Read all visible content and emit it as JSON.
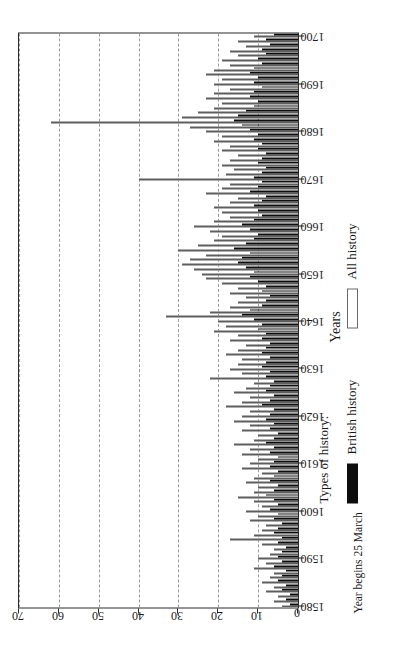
{
  "figure": {
    "y_axis_title": "Occurrences of titles",
    "x_axis_title": "Years",
    "x_axis_note": "Year begins 25 March"
  },
  "legend": {
    "title": "Types of history:",
    "items": [
      {
        "label": "British history",
        "swatch": "black-filled-swatch",
        "color": "#0d0d0d"
      },
      {
        "label": "All history",
        "swatch": "white-outlined-swatch",
        "color": "#ffffff"
      }
    ]
  },
  "chart_data": {
    "type": "bar",
    "title": "",
    "subtitle": "",
    "orientation": "horizontal-rotated",
    "xlabel": "Years",
    "ylabel": "Occurrences of titles",
    "xlim": [
      1580,
      1700
    ],
    "ylim": [
      0,
      70
    ],
    "yticks": [
      0,
      10,
      20,
      30,
      40,
      50,
      60,
      70
    ],
    "xticks": [
      1580,
      1590,
      1600,
      1610,
      1620,
      1630,
      1640,
      1650,
      1660,
      1670,
      1680,
      1690,
      1700
    ],
    "grid": "dashed-gridlines-at-y-multiples-of-10",
    "legend_position": "below-axis-left",
    "annotations": [
      "Year begins 25 March"
    ],
    "x": [
      1580,
      1581,
      1582,
      1583,
      1584,
      1585,
      1586,
      1587,
      1588,
      1589,
      1590,
      1591,
      1592,
      1593,
      1594,
      1595,
      1596,
      1597,
      1598,
      1599,
      1600,
      1601,
      1602,
      1603,
      1604,
      1605,
      1606,
      1607,
      1608,
      1609,
      1610,
      1611,
      1612,
      1613,
      1614,
      1615,
      1616,
      1617,
      1618,
      1619,
      1620,
      1621,
      1622,
      1623,
      1624,
      1625,
      1626,
      1627,
      1628,
      1629,
      1630,
      1631,
      1632,
      1633,
      1634,
      1635,
      1636,
      1637,
      1638,
      1639,
      1640,
      1641,
      1642,
      1643,
      1644,
      1645,
      1646,
      1647,
      1648,
      1649,
      1650,
      1651,
      1652,
      1653,
      1654,
      1655,
      1656,
      1657,
      1658,
      1659,
      1660,
      1661,
      1662,
      1663,
      1664,
      1665,
      1666,
      1667,
      1668,
      1669,
      1670,
      1671,
      1672,
      1673,
      1674,
      1675,
      1676,
      1677,
      1678,
      1679,
      1680,
      1681,
      1682,
      1683,
      1684,
      1685,
      1686,
      1687,
      1688,
      1689,
      1690,
      1691,
      1692,
      1693,
      1694,
      1695,
      1696,
      1697,
      1698,
      1699,
      1700
    ],
    "series": [
      {
        "name": "British history",
        "color": "#0d0d0d",
        "values": [
          2,
          3,
          2,
          4,
          3,
          5,
          4,
          3,
          6,
          4,
          5,
          4,
          3,
          5,
          4,
          6,
          5,
          4,
          6,
          5,
          7,
          5,
          6,
          8,
          6,
          5,
          7,
          6,
          5,
          7,
          6,
          5,
          7,
          6,
          8,
          6,
          5,
          7,
          6,
          8,
          7,
          6,
          9,
          7,
          6,
          8,
          7,
          6,
          8,
          7,
          9,
          8,
          7,
          9,
          8,
          7,
          9,
          8,
          10,
          9,
          11,
          14,
          12,
          9,
          8,
          7,
          9,
          8,
          10,
          12,
          11,
          13,
          15,
          14,
          12,
          16,
          13,
          11,
          10,
          12,
          14,
          11,
          9,
          10,
          11,
          9,
          8,
          12,
          10,
          9,
          11,
          9,
          8,
          10,
          9,
          8,
          10,
          9,
          11,
          10,
          12,
          14,
          16,
          15,
          13,
          11,
          10,
          12,
          11,
          9,
          11,
          10,
          12,
          11,
          9,
          10,
          8,
          9,
          7,
          8,
          6
        ]
      },
      {
        "name": "All history",
        "color": "#ffffff",
        "values": [
          4,
          6,
          5,
          8,
          6,
          9,
          7,
          6,
          11,
          8,
          10,
          7,
          6,
          9,
          17,
          11,
          9,
          8,
          12,
          10,
          13,
          9,
          11,
          15,
          11,
          10,
          13,
          11,
          9,
          14,
          12,
          10,
          14,
          12,
          16,
          11,
          10,
          14,
          12,
          16,
          14,
          12,
          18,
          14,
          12,
          16,
          13,
          11,
          22,
          14,
          17,
          15,
          14,
          18,
          15,
          13,
          17,
          15,
          21,
          18,
          20,
          33,
          22,
          17,
          15,
          13,
          17,
          15,
          19,
          23,
          24,
          26,
          29,
          27,
          23,
          30,
          25,
          21,
          19,
          22,
          26,
          21,
          17,
          19,
          21,
          17,
          15,
          23,
          19,
          17,
          40,
          18,
          16,
          19,
          17,
          15,
          19,
          17,
          21,
          19,
          23,
          27,
          62,
          29,
          25,
          21,
          19,
          23,
          21,
          17,
          21,
          19,
          23,
          21,
          17,
          19,
          15,
          17,
          13,
          15,
          11
        ]
      }
    ]
  }
}
